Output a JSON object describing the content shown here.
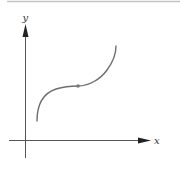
{
  "diagram": {
    "type": "function-graph",
    "axes": {
      "x_label": "x",
      "y_label": "y"
    },
    "colors": {
      "axis": "#555555",
      "curve": "#6e6e6e",
      "point": "#7a7a7a",
      "top_rule": "#bdbdbd"
    },
    "curve": {
      "start": [
        37,
        121
      ],
      "inflection_point": [
        78,
        86
      ],
      "end": [
        116,
        46
      ]
    },
    "marked_points": [
      {
        "name": "inflection-point",
        "x": 78,
        "y": 86
      }
    ]
  }
}
